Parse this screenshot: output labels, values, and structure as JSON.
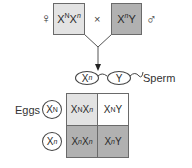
{
  "parents": {
    "female": {
      "symbol": "♀",
      "genotype": {
        "base1": "X",
        "allele1": "N",
        "base2": "X",
        "allele2": "n"
      },
      "color": "#e3e3e3"
    },
    "cross_symbol": "×",
    "male": {
      "symbol": "♂",
      "genotype": {
        "base1": "X",
        "allele1": "n",
        "base2": "Y"
      },
      "color": "#b1b1b1"
    }
  },
  "gametes": {
    "sperm_label": "Sperm",
    "sperm": [
      {
        "base": "X",
        "allele": "n"
      },
      {
        "base": "Y",
        "allele": ""
      }
    ],
    "eggs_label": "Eggs",
    "eggs": [
      {
        "base": "X",
        "allele": "N"
      },
      {
        "base": "X",
        "allele": "n"
      }
    ]
  },
  "punnett": {
    "cells": [
      {
        "base1": "X",
        "allele1": "N",
        "base2": "X",
        "allele2": "n",
        "color": "#e3e3e3"
      },
      {
        "base1": "X",
        "allele1": "N",
        "base2": "Y",
        "allele2": "",
        "color": "#ffffff"
      },
      {
        "base1": "X",
        "allele1": "n",
        "base2": "X",
        "allele2": "n",
        "color": "#b1b1b1"
      },
      {
        "base1": "X",
        "allele1": "n",
        "base2": "Y",
        "allele2": "",
        "color": "#b1b1b1"
      }
    ]
  }
}
